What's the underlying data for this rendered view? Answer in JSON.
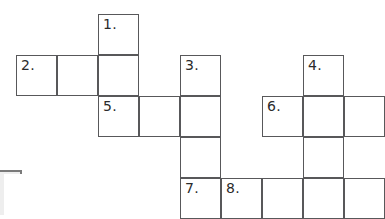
{
  "puzzle": {
    "type": "crossword-grid",
    "title": "Crossword puzzle grid",
    "cell_size": 41,
    "origin": {
      "x": 16,
      "y": 14
    },
    "colors": {
      "background": "#ffffff",
      "cell_fill": "#ffffff",
      "cell_border": "#58585a",
      "number_text": "#2b2b2b",
      "panel_fill": "#eeeeee",
      "panel_border": "#7a7a7a"
    },
    "cells": [
      {
        "id": "c-r0-c2",
        "row": 0,
        "col": 2,
        "number": "1."
      },
      {
        "id": "c-r1-c0",
        "row": 1,
        "col": 0,
        "number": "2."
      },
      {
        "id": "c-r1-c1",
        "row": 1,
        "col": 1,
        "number": ""
      },
      {
        "id": "c-r1-c2",
        "row": 1,
        "col": 2,
        "number": ""
      },
      {
        "id": "c-r1-c4",
        "row": 1,
        "col": 4,
        "number": "3."
      },
      {
        "id": "c-r1-c7",
        "row": 1,
        "col": 7,
        "number": "4."
      },
      {
        "id": "c-r2-c2",
        "row": 2,
        "col": 2,
        "number": "5."
      },
      {
        "id": "c-r2-c3",
        "row": 2,
        "col": 3,
        "number": ""
      },
      {
        "id": "c-r2-c4",
        "row": 2,
        "col": 4,
        "number": ""
      },
      {
        "id": "c-r2-c6",
        "row": 2,
        "col": 6,
        "number": "6."
      },
      {
        "id": "c-r2-c7",
        "row": 2,
        "col": 7,
        "number": ""
      },
      {
        "id": "c-r2-c8",
        "row": 2,
        "col": 8,
        "number": ""
      },
      {
        "id": "c-r3-c4",
        "row": 3,
        "col": 4,
        "number": ""
      },
      {
        "id": "c-r3-c7",
        "row": 3,
        "col": 7,
        "number": ""
      },
      {
        "id": "c-r4-c4",
        "row": 4,
        "col": 4,
        "number": "7."
      },
      {
        "id": "c-r4-c5",
        "row": 4,
        "col": 5,
        "number": "8."
      },
      {
        "id": "c-r4-c6",
        "row": 4,
        "col": 6,
        "number": ""
      },
      {
        "id": "c-r4-c7",
        "row": 4,
        "col": 7,
        "number": ""
      },
      {
        "id": "c-r4-c8",
        "row": 4,
        "col": 8,
        "number": ""
      }
    ],
    "clue_numbers": [
      "1.",
      "2.",
      "3.",
      "4.",
      "5.",
      "6.",
      "7.",
      "8."
    ],
    "corner_panel": {
      "x": 0,
      "y": 170,
      "width": 22,
      "height": 45
    }
  }
}
